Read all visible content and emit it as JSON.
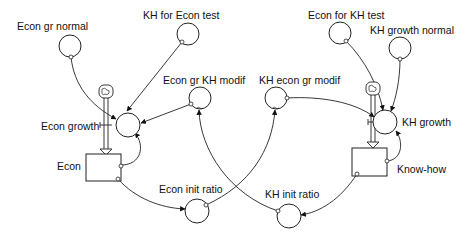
{
  "diagram": {
    "type": "stock-and-flow",
    "stocks": [
      {
        "id": "econ",
        "label": "Econ"
      },
      {
        "id": "knowhow",
        "label": "Know-how"
      }
    ],
    "flows": [
      {
        "id": "econ_growth",
        "label": "Econ growth",
        "into": "econ"
      },
      {
        "id": "kh_growth",
        "label": "KH growth",
        "into": "knowhow"
      }
    ],
    "auxiliaries": [
      {
        "id": "econ_gr_normal",
        "label": "Econ gr normal"
      },
      {
        "id": "kh_for_econ_test",
        "label": "KH for Econ test"
      },
      {
        "id": "econ_gr_kh_modif",
        "label": "Econ gr KH modif"
      },
      {
        "id": "kh_econ_gr_modif",
        "label": "KH econ gr modif"
      },
      {
        "id": "econ_for_kh_test",
        "label": "Econ for KH test"
      },
      {
        "id": "kh_growth_normal",
        "label": "KH growth normal"
      },
      {
        "id": "econ_init_ratio",
        "label": "Econ init ratio"
      },
      {
        "id": "kh_init_ratio",
        "label": "KH init ratio"
      }
    ],
    "links": [
      {
        "from": "econ_gr_normal",
        "to": "econ_growth"
      },
      {
        "from": "kh_for_econ_test",
        "to": "econ_growth"
      },
      {
        "from": "econ_gr_kh_modif",
        "to": "econ_growth"
      },
      {
        "from": "econ",
        "to": "econ_growth"
      },
      {
        "from": "econ",
        "to": "econ_init_ratio"
      },
      {
        "from": "econ_init_ratio",
        "to": "kh_econ_gr_modif"
      },
      {
        "from": "kh_init_ratio",
        "to": "econ_gr_kh_modif"
      },
      {
        "from": "knowhow",
        "to": "kh_init_ratio"
      },
      {
        "from": "knowhow",
        "to": "kh_growth"
      },
      {
        "from": "econ_for_kh_test",
        "to": "kh_growth"
      },
      {
        "from": "kh_growth_normal",
        "to": "kh_growth"
      },
      {
        "from": "kh_econ_gr_modif",
        "to": "kh_growth"
      }
    ]
  }
}
